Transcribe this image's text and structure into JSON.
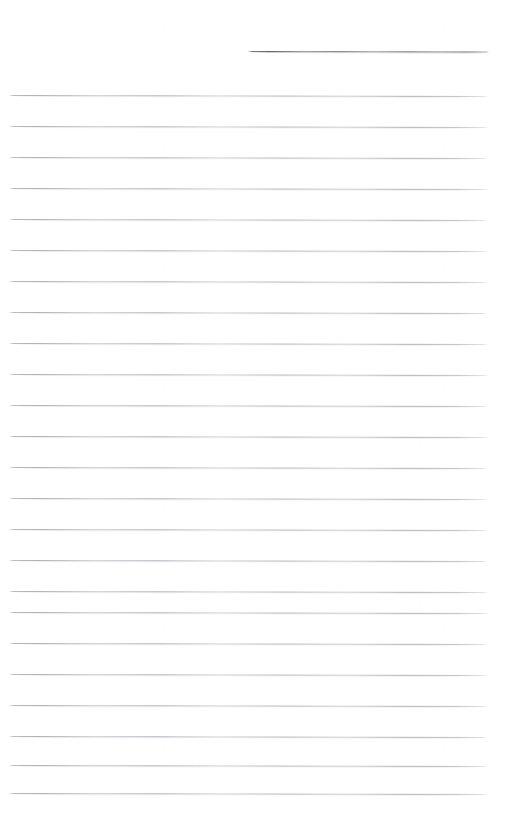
{
  "document": {
    "kind": "scanned-blank-ruled-page",
    "page_width": 510,
    "page_height": 830,
    "background_color": "#fefefe",
    "content_text": "",
    "handwriting_present": "none",
    "printed_text_present": "none"
  },
  "header_rule": {
    "name": "header-line",
    "x_start": 248,
    "x_end": 489,
    "y": 51,
    "thickness": 1,
    "color": "#6e6e78",
    "description": "darker short rule across upper-right of page"
  },
  "ruling": {
    "name": "body-ruled-lines",
    "color": "#b0b0b8",
    "thickness": 1,
    "x_start": 9,
    "x_end": 488,
    "spacing": 31,
    "first_y": 95,
    "count": 24,
    "lines": [
      {
        "index": 1,
        "y": 95
      },
      {
        "index": 2,
        "y": 126
      },
      {
        "index": 3,
        "y": 157
      },
      {
        "index": 4,
        "y": 188
      },
      {
        "index": 5,
        "y": 219
      },
      {
        "index": 6,
        "y": 250
      },
      {
        "index": 7,
        "y": 281
      },
      {
        "index": 8,
        "y": 312
      },
      {
        "index": 9,
        "y": 343
      },
      {
        "index": 10,
        "y": 374
      },
      {
        "index": 11,
        "y": 405
      },
      {
        "index": 12,
        "y": 436
      },
      {
        "index": 13,
        "y": 467
      },
      {
        "index": 14,
        "y": 498
      },
      {
        "index": 15,
        "y": 529
      },
      {
        "index": 16,
        "y": 560
      },
      {
        "index": 17,
        "y": 591
      },
      {
        "index": 18,
        "y": 612
      },
      {
        "index": 19,
        "y": 643
      },
      {
        "index": 20,
        "y": 674
      },
      {
        "index": 21,
        "y": 705
      },
      {
        "index": 22,
        "y": 736
      },
      {
        "index": 23,
        "y": 765
      },
      {
        "index": 24,
        "y": 793
      }
    ]
  },
  "margins": {
    "top_blank_height": 51,
    "bottom_blank_height": 37,
    "left_blank_width": 9,
    "right_blank_width": 22
  }
}
